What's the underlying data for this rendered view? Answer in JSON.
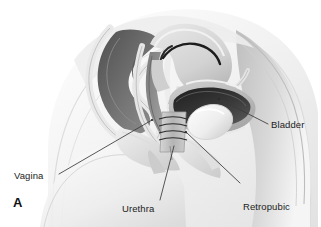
{
  "figure": {
    "type": "medical-anatomical-illustration",
    "panel_letter": "A",
    "background_color": "#ffffff",
    "line_color": "#3a3a3a",
    "text_color": "#1b1b1b"
  },
  "labels": {
    "vagina": "Vagina",
    "urethra": "Urethra",
    "bladder": "Bladder",
    "retropubic_line1": "Retropubic",
    "retropubic_line2": "suspension"
  },
  "structures": [
    {
      "name": "body-outline",
      "tone": "#f4f4f4"
    },
    {
      "name": "rectum",
      "tone": "#6e6e6e"
    },
    {
      "name": "vaginal-canal",
      "tone": "#9a9a9a"
    },
    {
      "name": "uterus",
      "tone": "#d8d8d8"
    },
    {
      "name": "bladder-cavity",
      "tone": "#2e2e2e"
    },
    {
      "name": "bladder-wall",
      "tone": "#bdbdbd"
    },
    {
      "name": "pubic-bone",
      "tone": "#f0f0f0"
    },
    {
      "name": "urethra-sutures",
      "tone": "#4a4a4a"
    },
    {
      "name": "abdominal-wall",
      "tone": "#c9c9c9"
    }
  ]
}
